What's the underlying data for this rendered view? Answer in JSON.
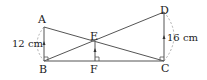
{
  "figure": {
    "points": {
      "A": {
        "label": "A",
        "x": 44,
        "y": 27
      },
      "B": {
        "label": "B",
        "x": 44,
        "y": 61
      },
      "C": {
        "label": "C",
        "x": 164,
        "y": 61
      },
      "D": {
        "label": "D",
        "x": 164,
        "y": 12
      },
      "E": {
        "label": "E",
        "x": 95,
        "y": 42
      },
      "F": {
        "label": "F",
        "x": 95,
        "y": 61
      }
    },
    "measurements": {
      "AB": "12 cm",
      "DC": "16 cm"
    },
    "colors": {
      "line": "#555555",
      "arc": "#999999",
      "text": "#222222"
    }
  }
}
